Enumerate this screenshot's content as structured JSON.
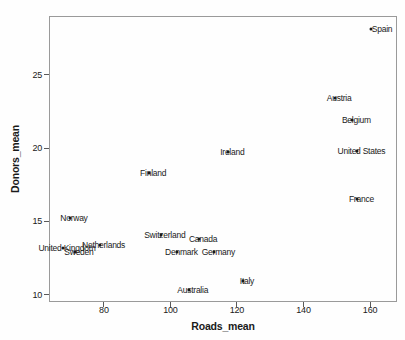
{
  "figure": {
    "background": "#fefefe",
    "border_color": "#9a9a9a",
    "text_color": "#1a1a1a",
    "marker_color": "#1a1a1a"
  },
  "chart_data": {
    "type": "scatter",
    "title": "",
    "xlabel": "Roads_mean",
    "ylabel": "Donors_mean",
    "xlim": [
      63.5,
      168.1
    ],
    "ylim": [
      9.5,
      29.0
    ],
    "x_ticks": [
      80,
      100,
      120,
      140,
      160
    ],
    "y_ticks": [
      10,
      15,
      20,
      25
    ],
    "grid": false,
    "legend": false,
    "marker": "filled-circle-with-centered-country-label",
    "points": [
      {
        "label": "Spain",
        "x": 160.3,
        "y": 28.1,
        "label_dx": 11
      },
      {
        "label": "Austria",
        "x": 149.5,
        "y": 23.4
      },
      {
        "label": "Belgium",
        "x": 154.7,
        "y": 21.9
      },
      {
        "label": "United States",
        "x": 156.2,
        "y": 19.8
      },
      {
        "label": "France",
        "x": 156.2,
        "y": 16.5
      },
      {
        "label": "Ireland",
        "x": 117.4,
        "y": 19.7
      },
      {
        "label": "Finland",
        "x": 93.6,
        "y": 18.3
      },
      {
        "label": "Norway",
        "x": 69.8,
        "y": 15.2
      },
      {
        "label": "United Kingdom",
        "x": 67.7,
        "y": 13.2
      },
      {
        "label": "Netherlands",
        "x": 78.7,
        "y": 13.4
      },
      {
        "label": "Sweden",
        "x": 71.3,
        "y": 12.9
      },
      {
        "label": "Switzerland",
        "x": 97.1,
        "y": 14.1
      },
      {
        "label": "Canada",
        "x": 108.6,
        "y": 13.8
      },
      {
        "label": "Denmark",
        "x": 102.1,
        "y": 12.9
      },
      {
        "label": "Germany",
        "x": 113.2,
        "y": 12.9
      },
      {
        "label": "Australia",
        "x": 105.5,
        "y": 10.3
      },
      {
        "label": "Italy",
        "x": 121.8,
        "y": 10.9
      }
    ]
  }
}
